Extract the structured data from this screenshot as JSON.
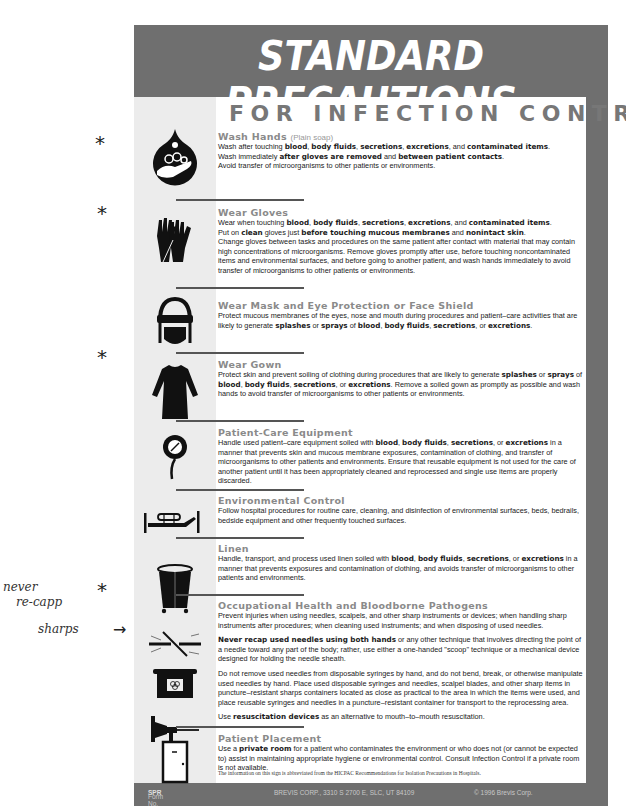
{
  "title": "STANDARD PRECAUTIONS",
  "subtitle": "FOR INFECTION CONTROL",
  "sections": [
    {
      "icon": "wash-hands-icon",
      "title": "Wash Hands",
      "title_note": "(Plain soap)",
      "paragraphs": [
        "Wash after touching <b>blood</b>, <b>body fluids</b>, <b>secretions</b>, <b>excretions</b>, and <b>contaminated items</b>.<br>Wash immediately <b>after gloves are removed</b> and <b>between patient contacts</b>.<br>Avoid transfer of microorganisms to other patients or environments."
      ]
    },
    {
      "icon": "gloves-icon",
      "title": "Wear Gloves",
      "paragraphs": [
        "Wear when touching <b>blood</b>, <b>body fluids</b>, <b>secretions</b>, <b>excretions</b>, and <b>contaminated items</b>.<br>Put on <b>clean</b> gloves just <b>before touching mucous membranes</b> and <b>nonintact skin</b>.<br>Change gloves between tasks and procedures on the same patient after contact with material that may contain high concentrations of microorganisms.  Remove gloves promptly after use, before touching noncontaminated items and environmental surfaces, and before going to another patient, and wash hands immediately to avoid transfer of microorganisms to other patients or environments."
      ]
    },
    {
      "icon": "mask-eye-protection-icon",
      "title": "Wear Mask and Eye Protection or Face Shield",
      "paragraphs": [
        "Protect mucous membranes of the eyes, nose and mouth during procedures and patient–care activities that are likely to generate <b>splashes</b> or <b>sprays</b> of <b>blood</b>, <b>body fluids</b>, <b>secretions</b>, or <b>excretions</b>."
      ]
    },
    {
      "icon": "gown-icon",
      "title": "Wear Gown",
      "paragraphs": [
        "Protect skin and prevent soiling of clothing during procedures that are likely to generate <b>splashes</b> or <b>sprays</b> of <b>blood</b>, <b>body fluids</b>, <b>secretions</b>, or <b>excretions</b>.  Remove a soiled gown as promptly as possible and wash hands to avoid transfer of microorganisms to other patients or environments."
      ]
    },
    {
      "icon": "patient-care-equipment-icon",
      "title": "Patient-Care Equipment",
      "paragraphs": [
        "Handle used patient–care equipment soiled with <b>blood</b>, <b>body fluids</b>, <b>secretions</b>, or <b>excretions</b> in a manner that prevents skin and mucous membrane exposures, contamination of clothing, and transfer of microorganisms to other patients and environments.  Ensure that reusable equipment is not used for the care of another patient until it has been appropriately cleaned and reprocessed and single use items are properly discarded."
      ]
    },
    {
      "icon": "bed-icon",
      "title": "Environmental Control",
      "paragraphs": [
        "Follow hospital procedures for routine care, cleaning, and disinfection of environmental surfaces, beds, bedrails, bedside equipment and other frequently touched surfaces."
      ]
    },
    {
      "icon": "linen-hamper-icon",
      "title": "Linen",
      "paragraphs": [
        "Handle, transport, and process used linen soiled with <b>blood</b>, <b>body fluids</b>, <b>secretions</b>, or <b>excretions</b> in a manner that prevents exposures and contamination of clothing, and avoids transfer of microorganisms to other patients and environments."
      ]
    },
    {
      "icon": "needle-sharps-icon",
      "title": "Occupational Health and Bloodborne Pathogens",
      "paragraphs": [
        "Prevent injuries when using needles, scalpels, and other sharp instruments or devices; when handling sharp instruments after procedures; when cleaning used instruments; and when disposing of used needles.",
        "<b>Never recap used needles using both hands</b> or any other technique that involves directing the point of a needle toward any part of the body; rather, use either a one-handed \"scoop\" technique or a mechanical device designed for holding the needle sheath.",
        "Do not remove used needles from disposable syringes by hand, and do not bend, break, or otherwise manipulate used needles by hand.  Place used disposable syringes and needles, scalpel blades, and other sharp items in puncture–resistant sharps containers located as close as practical to the area in which the items were used, and place reusable syringes and needles in a puncture–resistant container for transport to the reprocessing area.",
        "Use <b>resuscitation devices</b> as an alternative to mouth–to–mouth resuscitation."
      ]
    },
    {
      "icon": "door-icon",
      "title": "Patient Placement",
      "paragraphs": [
        "Use a <b>private room</b> for a patient who contaminates the environment or who does not (or cannot be expected to) assist in maintaining appropriate hygiene or environmental control.  Consult Infection Control if a private room is not available."
      ]
    }
  ],
  "disclaimer": "The information on this sign is abbreviated from the HICPAC Recommendations for Isolation Precautions in Hospitals.",
  "footer": {
    "form_label": "Form No.",
    "form_no": "SPR",
    "address": "BREVIS CORP., 3310 S 2700 E, SLC, UT 84109",
    "copyright": "© 1996 Brevis Corp."
  },
  "handwritten": {
    "stars": [
      "*",
      "*",
      "*",
      "*"
    ],
    "note_line1": "never",
    "note_line2": "re-capp",
    "note_sharps": "sharps",
    "arrow": "→"
  },
  "colors": {
    "frame": "#6f6f6f",
    "icon_column": "#ececec",
    "section_title": "#8a8a8a",
    "subtitle": "#777777"
  }
}
